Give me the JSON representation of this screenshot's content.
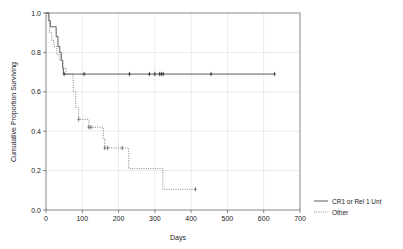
{
  "chart_data": {
    "type": "line",
    "subtype": "kaplan-meier-survival",
    "title": "",
    "xlabel": "Days",
    "ylabel": "Cumulative Proportion Surviving",
    "xlim": [
      0,
      700
    ],
    "ylim": [
      0.0,
      1.0
    ],
    "xticks": [
      0,
      100,
      200,
      300,
      400,
      500,
      600,
      700
    ],
    "xtick_labels": [
      "0",
      "100",
      "200",
      "300",
      "400",
      "500",
      "600",
      "700"
    ],
    "yticks": [
      0.0,
      0.2,
      0.4,
      0.6,
      0.8,
      1.0
    ],
    "ytick_labels": [
      "0.0",
      "0.2",
      "0.4",
      "0.6",
      "0.8",
      "1.0"
    ],
    "grid": true,
    "grid_color": "#d9d9d9",
    "frame_color": "#555555",
    "legend_position": "right-bottom-outside",
    "series": [
      {
        "name": "CR1 or Rel 1 Unt",
        "linestyle": "solid",
        "color": "#333333",
        "steps": [
          {
            "x": 0,
            "y": 1.0
          },
          {
            "x": 8,
            "y": 0.96
          },
          {
            "x": 12,
            "y": 0.93
          },
          {
            "x": 16,
            "y": 0.93
          },
          {
            "x": 20,
            "y": 0.93
          },
          {
            "x": 28,
            "y": 0.88
          },
          {
            "x": 33,
            "y": 0.83
          },
          {
            "x": 38,
            "y": 0.8
          },
          {
            "x": 42,
            "y": 0.76
          },
          {
            "x": 46,
            "y": 0.72
          },
          {
            "x": 48,
            "y": 0.69
          },
          {
            "x": 630,
            "y": 0.69
          }
        ],
        "censored_x": [
          50,
          105,
          230,
          285,
          300,
          313,
          318,
          323,
          455,
          630
        ],
        "censored_y": 0.69
      },
      {
        "name": "Other",
        "linestyle": "dotted",
        "color": "#666666",
        "steps": [
          {
            "x": 0,
            "y": 1.0
          },
          {
            "x": 6,
            "y": 0.96
          },
          {
            "x": 10,
            "y": 0.9
          },
          {
            "x": 16,
            "y": 0.86
          },
          {
            "x": 22,
            "y": 0.83
          },
          {
            "x": 30,
            "y": 0.79
          },
          {
            "x": 38,
            "y": 0.76
          },
          {
            "x": 46,
            "y": 0.72
          },
          {
            "x": 55,
            "y": 0.69
          },
          {
            "x": 70,
            "y": 0.69
          },
          {
            "x": 75,
            "y": 0.6
          },
          {
            "x": 82,
            "y": 0.52
          },
          {
            "x": 90,
            "y": 0.46
          },
          {
            "x": 112,
            "y": 0.46
          },
          {
            "x": 118,
            "y": 0.42
          },
          {
            "x": 150,
            "y": 0.42
          },
          {
            "x": 158,
            "y": 0.36
          },
          {
            "x": 162,
            "y": 0.315
          },
          {
            "x": 225,
            "y": 0.315
          },
          {
            "x": 228,
            "y": 0.21
          },
          {
            "x": 318,
            "y": 0.21
          },
          {
            "x": 322,
            "y": 0.105
          },
          {
            "x": 412,
            "y": 0.105
          }
        ],
        "censored": [
          {
            "x": 90,
            "y": 0.46
          },
          {
            "x": 118,
            "y": 0.42
          },
          {
            "x": 124,
            "y": 0.42
          },
          {
            "x": 162,
            "y": 0.315
          },
          {
            "x": 170,
            "y": 0.315
          },
          {
            "x": 210,
            "y": 0.315
          },
          {
            "x": 412,
            "y": 0.105
          }
        ]
      }
    ]
  },
  "legend": {
    "entries": [
      {
        "label": "CR1 or Rel 1 Unt",
        "style": "solid"
      },
      {
        "label": "Other",
        "style": "dotted"
      }
    ]
  }
}
